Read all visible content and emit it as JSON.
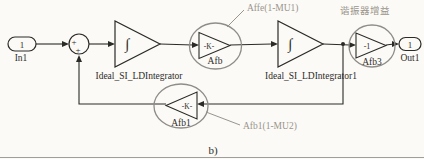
{
  "figure": {
    "caption": "b)",
    "colors": {
      "background": "#fbfaf7",
      "line": "#2a2a26",
      "highlight_ellipse": "#8f8d88",
      "annotation_text": "#9a948b"
    },
    "ports": {
      "in": {
        "number": "1",
        "label": "In1"
      },
      "out": {
        "number": "1",
        "label": "Out1"
      }
    },
    "sum": {
      "sign_left": "+",
      "sign_bottom": "+"
    },
    "blocks": {
      "integrator1": {
        "symbol": "∫",
        "label": "Ideal_SI_LDIntegrator"
      },
      "integrator2": {
        "symbol": "∫",
        "label": "Ideal_SI_LDIntegrator1"
      },
      "gain_afb": {
        "value": "-K-",
        "label": "Afb"
      },
      "gain_afb3": {
        "value": "-1",
        "label": "Afb3"
      },
      "gain_afb1": {
        "value": "-K-",
        "label": "Afb1"
      }
    },
    "annotations": {
      "afb_formula": "Affe(1-MU1)",
      "resonator_gain_cn": "谐振器增益",
      "afb1_formula": "Afb1(1-MU2)"
    }
  }
}
